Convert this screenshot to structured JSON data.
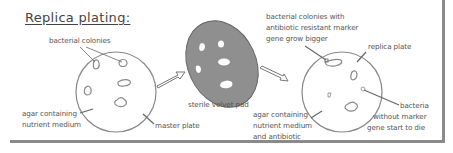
{
  "title": "Replica plating:",
  "labels": {
    "master_colonies": "bacterial colonies",
    "master_agar_1": "agar containing",
    "master_agar_2": "nutrient medium",
    "master_plate": "master plate",
    "velvet_pad": "sterile velvet pad",
    "resistant_1": "bacterial colonies with",
    "resistant_2": "antibiotic resistant marker",
    "resistant_3": "gene grow bigger",
    "replica_plate": "replica plate",
    "replica_agar_1": "agar containing",
    "replica_agar_2": "nutrient medium",
    "replica_agar_3": "and antibiotic",
    "dying_1": "bacteria",
    "dying_2": "without marker",
    "dying_3": "gene start to die"
  },
  "colors": {
    "outline": "#888888",
    "pad_fill": "#8f8f8f",
    "text": "#555555",
    "frame": "#8a8a8a"
  }
}
